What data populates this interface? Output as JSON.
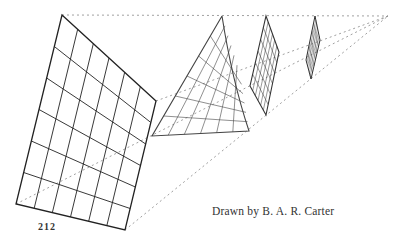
{
  "figure": {
    "page_number": "212",
    "caption": "Drawn by B. A. R. Carter",
    "vanishing_point": [
      388,
      16
    ],
    "line_color": "#333333",
    "construction_line_color": "#888888"
  }
}
